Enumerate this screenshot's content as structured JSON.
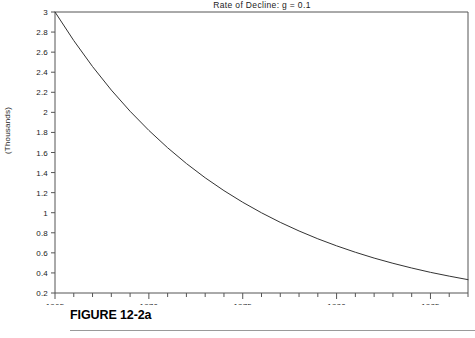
{
  "figure": {
    "caption": "FIGURE 12-2a",
    "ylabel": "(Thousands)"
  },
  "chart_data": {
    "type": "line",
    "title": "Rate of Decline:  g  =  0.1",
    "xlabel": "",
    "ylabel": "(Thousands)",
    "xlim": [
      1965,
      1987
    ],
    "ylim": [
      0.2,
      3
    ],
    "grid": false,
    "legend": "none",
    "x_ticks": [
      1965,
      1970,
      1975,
      1980,
      1985
    ],
    "x_tick_labels": [
      "1965",
      "1970",
      "1975",
      "1980",
      "1985"
    ],
    "x_minor_tick_step": 1,
    "y_ticks": [
      0.2,
      0.4,
      0.6,
      0.8,
      1,
      1.2,
      1.4,
      1.6,
      1.8,
      2,
      2.2,
      2.4,
      2.6,
      2.8,
      3
    ],
    "y_tick_labels": [
      "0.2",
      "0.4",
      "0.6",
      "0.8",
      "1",
      "1.2",
      "1.4",
      "1.6",
      "1.8",
      "2",
      "2.2",
      "2.4",
      "2.6",
      "2.8",
      "3"
    ],
    "series": [
      {
        "name": "Exponential decline g = 0.1",
        "color": "#333333",
        "x": [
          1965,
          1966,
          1967,
          1968,
          1969,
          1970,
          1971,
          1972,
          1973,
          1974,
          1975,
          1976,
          1977,
          1978,
          1979,
          1980,
          1981,
          1982,
          1983,
          1984,
          1985,
          1986,
          1987
        ],
        "values": [
          3.0,
          2.715,
          2.456,
          2.222,
          2.011,
          1.82,
          1.647,
          1.49,
          1.348,
          1.22,
          1.104,
          0.999,
          0.904,
          0.818,
          0.74,
          0.67,
          0.606,
          0.548,
          0.496,
          0.449,
          0.406,
          0.368,
          0.333
        ]
      }
    ]
  }
}
